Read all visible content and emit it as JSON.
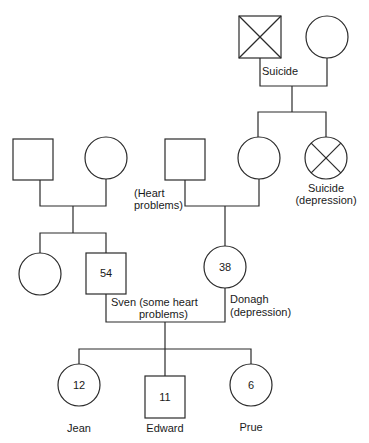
{
  "diagram": {
    "type": "genogram",
    "generations": [
      {
        "level": 1,
        "people": [
          {
            "id": "maternal-great-grandfather",
            "sex": "male",
            "deceased": true,
            "label": "Suicide",
            "age": ""
          },
          {
            "id": "maternal-great-grandmother",
            "sex": "female",
            "deceased": false,
            "label": "",
            "age": ""
          }
        ]
      },
      {
        "level": 2,
        "people": [
          {
            "id": "paternal-grandfather",
            "sex": "male",
            "deceased": false,
            "label": "",
            "age": ""
          },
          {
            "id": "paternal-grandmother",
            "sex": "female",
            "deceased": false,
            "label": "",
            "age": ""
          },
          {
            "id": "maternal-grandfather",
            "sex": "male",
            "deceased": false,
            "label_lines": [
              "(Heart",
              "problems)"
            ],
            "age": ""
          },
          {
            "id": "maternal-grandmother",
            "sex": "female",
            "deceased": false,
            "label": "",
            "age": ""
          },
          {
            "id": "maternal-great-aunt",
            "sex": "female",
            "deceased": true,
            "label_lines": [
              "Suicide",
              "(depression)"
            ],
            "age": ""
          }
        ]
      },
      {
        "level": 3,
        "people": [
          {
            "id": "sven-sister",
            "sex": "female",
            "deceased": false,
            "label": "",
            "age": ""
          },
          {
            "id": "sven",
            "sex": "male",
            "deceased": false,
            "label_lines": [
              "Sven (some heart",
              "problems)"
            ],
            "age": "54"
          },
          {
            "id": "donagh",
            "sex": "female",
            "deceased": false,
            "label_lines": [
              "Donagh",
              "(depression)"
            ],
            "age": "38"
          }
        ]
      },
      {
        "level": 4,
        "people": [
          {
            "id": "jean",
            "sex": "female",
            "deceased": false,
            "label": "Jean",
            "age": "12"
          },
          {
            "id": "edward",
            "sex": "male",
            "deceased": false,
            "label": "Edward",
            "age": "11"
          },
          {
            "id": "prue",
            "sex": "female",
            "deceased": false,
            "label": "Prue",
            "age": "6"
          }
        ]
      }
    ]
  },
  "labels": {
    "great_grandfather": "Suicide",
    "grandfather_line1": "(Heart",
    "grandfather_line2": "problems)",
    "great_aunt_line1": "Suicide",
    "great_aunt_line2": "(depression)",
    "sven_line1": "Sven (some heart",
    "sven_line2": "problems)",
    "donagh_line1": "Donagh",
    "donagh_line2": "(depression)",
    "jean": "Jean",
    "edward": "Edward",
    "prue": "Prue"
  },
  "ages": {
    "sven": "54",
    "donagh": "38",
    "jean": "12",
    "edward": "11",
    "prue": "6"
  },
  "colors": {
    "stroke": "#2a2a2a",
    "text": "#1a1a1a",
    "background": "#ffffff"
  }
}
